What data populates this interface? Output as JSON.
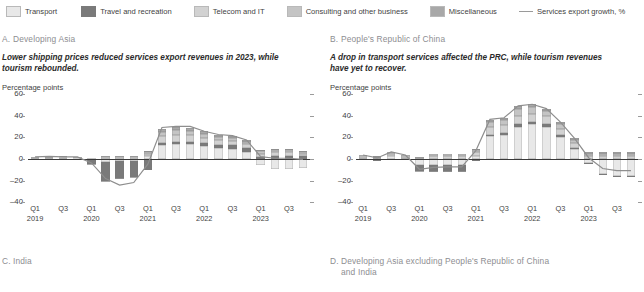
{
  "legend": {
    "items": [
      {
        "label": "Transport",
        "color": "#e8e8e8",
        "type": "swatch",
        "name": "legend-transport"
      },
      {
        "label": "Travel and recreation",
        "color": "#7a7a7a",
        "type": "swatch",
        "name": "legend-travel-recreation"
      },
      {
        "label": "Telecom and IT",
        "color": "#d2d2d2",
        "type": "swatch",
        "name": "legend-telecom-it"
      },
      {
        "label": "Consulting and other business",
        "color": "#c4c4c4",
        "type": "swatch",
        "name": "legend-consulting"
      },
      {
        "label": "Miscellaneous",
        "color": "#a8a8a8",
        "type": "swatch",
        "name": "legend-miscellaneous"
      },
      {
        "label": "Services export growth, %",
        "color": "#9a9a9a",
        "type": "line",
        "name": "legend-services-export-growth"
      }
    ]
  },
  "panels": {
    "a": {
      "letter": "A.",
      "title": "Developing Asia",
      "subtitle": "Lower shipping prices reduced services export revenues in 2023, while tourism rebounded.",
      "axis_title": "Percentage points"
    },
    "b": {
      "letter": "B.",
      "title": "People's Republic of China",
      "subtitle": "A drop in transport services affected the PRC, while tourism revenues have yet to recover.",
      "axis_title": "Percentage points"
    },
    "c": {
      "letter": "C.",
      "title": "India"
    },
    "d": {
      "letter": "D.",
      "title": "Developing Asia excluding People's Republic of China and India"
    }
  },
  "chart_data": [
    {
      "id": "panel-a",
      "type": "bar",
      "title": "Developing Asia",
      "subtitle": "Lower shipping prices reduced services export revenues in 2023, while tourism rebounded.",
      "ylabel": "Percentage points",
      "xlabel": "",
      "ylim": [
        -40,
        60
      ],
      "yticks": [
        -40,
        -20,
        0,
        20,
        40,
        60
      ],
      "grid": false,
      "legend_position": "top",
      "x": [
        "Q1 2019",
        "Q2 2019",
        "Q3 2019",
        "Q4 2019",
        "Q1 2020",
        "Q2 2020",
        "Q3 2020",
        "Q4 2020",
        "Q1 2021",
        "Q2 2021",
        "Q3 2021",
        "Q4 2021",
        "Q1 2022",
        "Q2 2022",
        "Q3 2022",
        "Q4 2022",
        "Q1 2023",
        "Q2 2023",
        "Q3 2023",
        "Q4 2023"
      ],
      "xtick_labels": [
        "Q1",
        "Q3",
        "Q1",
        "Q3",
        "Q1",
        "Q3",
        "Q1",
        "Q3",
        "Q1",
        "Q3"
      ],
      "xtick_years": [
        "2019",
        "2020",
        "2021",
        "2022",
        "2023"
      ],
      "series": [
        {
          "name": "Transport",
          "color": "#e8e8e8",
          "values": [
            0.6,
            0.8,
            0.6,
            0.5,
            -0.8,
            -3.0,
            -2.0,
            -1.5,
            3.0,
            13.0,
            14.0,
            14.0,
            12.0,
            10.0,
            9.0,
            6.0,
            -6.0,
            -9.0,
            -9.0,
            -8.0
          ]
        },
        {
          "name": "Travel and recreation",
          "color": "#7a7a7a",
          "values": [
            -0.5,
            -0.6,
            -0.5,
            -0.4,
            -3.5,
            -17.0,
            -16.0,
            -15.0,
            -10.0,
            2.0,
            2.0,
            2.0,
            2.5,
            3.0,
            3.5,
            4.0,
            2.0,
            3.0,
            3.0,
            2.5
          ]
        },
        {
          "name": "Telecom and IT",
          "color": "#d2d2d2",
          "values": [
            0.8,
            1.0,
            0.9,
            0.8,
            0.5,
            1.5,
            1.5,
            1.5,
            2.0,
            6.0,
            6.5,
            6.0,
            5.0,
            4.5,
            4.0,
            3.5,
            3.0,
            3.0,
            3.0,
            2.5
          ]
        },
        {
          "name": "Consulting and other business",
          "color": "#c4c4c4",
          "values": [
            0.5,
            0.6,
            0.5,
            0.5,
            0.3,
            1.0,
            1.0,
            1.0,
            1.5,
            4.0,
            4.5,
            4.0,
            3.5,
            3.0,
            3.0,
            2.5,
            2.0,
            2.0,
            2.0,
            1.5
          ]
        },
        {
          "name": "Miscellaneous",
          "color": "#a8a8a8",
          "values": [
            0.3,
            0.4,
            0.3,
            0.3,
            -0.3,
            -0.8,
            -0.8,
            -0.5,
            1.0,
            3.0,
            3.0,
            3.0,
            2.5,
            2.0,
            2.0,
            1.5,
            1.0,
            1.5,
            1.5,
            1.0
          ]
        }
      ],
      "line": {
        "name": "Services export growth, %",
        "color": "#8e8e8e",
        "values": [
          1.7,
          2.2,
          1.8,
          1.7,
          -3.8,
          -18.3,
          -24.3,
          -22.0,
          -5.0,
          29.0,
          30.0,
          30.0,
          25.5,
          22.5,
          21.5,
          17.5,
          2.0,
          0.5,
          0.5,
          -0.5
        ]
      }
    },
    {
      "id": "panel-b",
      "type": "bar",
      "title": "People's Republic of China",
      "subtitle": "A drop in transport services affected the PRC, while tourism revenues have yet to recover.",
      "ylabel": "Percentage points",
      "xlabel": "",
      "ylim": [
        -40,
        60
      ],
      "yticks": [
        -40,
        -20,
        0,
        20,
        40,
        60
      ],
      "grid": false,
      "legend_position": "top",
      "x": [
        "Q1 2019",
        "Q2 2019",
        "Q3 2019",
        "Q4 2019",
        "Q1 2020",
        "Q2 2020",
        "Q3 2020",
        "Q4 2020",
        "Q1 2021",
        "Q2 2021",
        "Q3 2021",
        "Q4 2021",
        "Q1 2022",
        "Q2 2022",
        "Q3 2022",
        "Q4 2022",
        "Q1 2023",
        "Q2 2023",
        "Q3 2023",
        "Q4 2023"
      ],
      "xtick_labels": [
        "Q1",
        "Q3",
        "Q1",
        "Q3",
        "Q1",
        "Q3",
        "Q1",
        "Q3",
        "Q1",
        "Q3"
      ],
      "xtick_years": [
        "2019",
        "2020",
        "2021",
        "2022",
        "2023"
      ],
      "series": [
        {
          "name": "Transport",
          "color": "#e8e8e8",
          "values": [
            1.0,
            -1.0,
            2.5,
            1.0,
            -6.0,
            -6.0,
            -6.0,
            -6.0,
            3.0,
            21.0,
            22.0,
            30.0,
            32.0,
            30.0,
            20.0,
            9.0,
            -4.0,
            -14.0,
            -16.0,
            -16.0
          ]
        },
        {
          "name": "Travel and recreation",
          "color": "#7a7a7a",
          "values": [
            -0.5,
            -0.5,
            -0.5,
            -0.5,
            -5.0,
            -5.5,
            -5.0,
            -5.0,
            -2.0,
            1.5,
            2.0,
            2.0,
            2.0,
            2.5,
            2.0,
            1.5,
            -1.0,
            -1.0,
            -1.0,
            -1.0
          ]
        },
        {
          "name": "Telecom and IT",
          "color": "#d2d2d2",
          "values": [
            1.5,
            1.0,
            2.0,
            1.5,
            1.0,
            2.5,
            2.5,
            2.5,
            3.0,
            7.0,
            7.0,
            8.0,
            8.0,
            7.0,
            6.0,
            4.0,
            3.0,
            3.0,
            3.0,
            3.0
          ]
        },
        {
          "name": "Consulting and other business",
          "color": "#c4c4c4",
          "values": [
            1.0,
            0.8,
            1.5,
            1.0,
            0.8,
            2.0,
            2.0,
            2.0,
            2.5,
            5.0,
            5.0,
            6.0,
            6.0,
            5.0,
            4.0,
            3.0,
            2.0,
            2.0,
            2.0,
            2.0
          ]
        },
        {
          "name": "Miscellaneous",
          "color": "#a8a8a8",
          "values": [
            0.5,
            0.5,
            0.8,
            0.5,
            -0.5,
            -1.0,
            -1.0,
            -1.0,
            1.0,
            2.0,
            2.0,
            3.0,
            2.5,
            2.0,
            2.0,
            1.5,
            1.0,
            1.0,
            1.0,
            1.0
          ]
        }
      ],
      "line": {
        "name": "Services export growth, %",
        "color": "#8e8e8e",
        "values": [
          3.5,
          0.8,
          6.3,
          3.5,
          -9.7,
          -8.0,
          -7.5,
          -7.5,
          7.5,
          36.5,
          38.0,
          49.0,
          50.5,
          46.5,
          34.0,
          19.0,
          1.0,
          -9.0,
          -11.0,
          -11.0
        ]
      }
    }
  ]
}
